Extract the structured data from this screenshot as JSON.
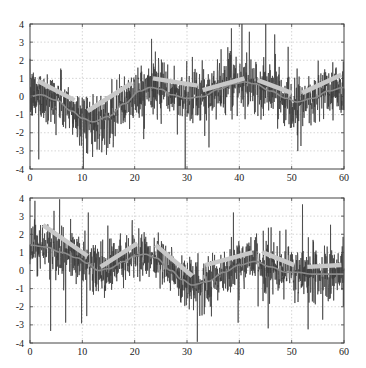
{
  "chart_data": [
    {
      "type": "line",
      "title": "",
      "xlabel": "",
      "ylabel": "",
      "xlim": [
        0,
        60
      ],
      "ylim": [
        -4,
        4
      ],
      "xticks": [
        0,
        10,
        20,
        30,
        40,
        50,
        60
      ],
      "yticks": [
        -4,
        -3,
        -2,
        -1,
        0,
        1,
        2,
        3,
        4
      ],
      "grid": true,
      "legend": null,
      "noise_std": 0.75,
      "series": [
        {
          "name": "noisy signal",
          "color": "#3a3a3a",
          "description": "dense high-frequency noisy trace around smooth curve"
        },
        {
          "name": "smooth underlying signal",
          "color": "#8a8a8a",
          "x": [
            0,
            2,
            5,
            8,
            10,
            12,
            15,
            18,
            21,
            23,
            25,
            27,
            30,
            33,
            36,
            39,
            41,
            43,
            46,
            49,
            51,
            54,
            57,
            60
          ],
          "y": [
            0.0,
            0.1,
            -0.2,
            -0.8,
            -1.2,
            -1.4,
            -1.1,
            -0.4,
            0.3,
            0.5,
            0.4,
            0.1,
            -0.1,
            0.0,
            0.4,
            0.7,
            0.8,
            0.7,
            0.3,
            -0.1,
            -0.3,
            -0.1,
            0.3,
            0.5
          ]
        },
        {
          "name": "piecewise linear trend segments",
          "color": "#c8c8c8",
          "segments": [
            [
              [
                1.5,
                0.85
              ],
              [
                8.5,
                -0.2
              ]
            ],
            [
              [
                11,
                -0.8
              ],
              [
                19.5,
                0.75
              ]
            ],
            [
              [
                23.5,
                1.0
              ],
              [
                32,
                0.6
              ]
            ],
            [
              [
                33,
                0.35
              ],
              [
                41,
                1.0
              ]
            ],
            [
              [
                43.5,
                0.9
              ],
              [
                50,
                0.2
              ]
            ],
            [
              [
                52,
                0.2
              ],
              [
                59.5,
                1.2
              ]
            ]
          ]
        }
      ]
    },
    {
      "type": "line",
      "title": "",
      "xlabel": "",
      "ylabel": "",
      "xlim": [
        0,
        60
      ],
      "ylim": [
        -4,
        4
      ],
      "xticks": [
        0,
        10,
        20,
        30,
        40,
        50,
        60
      ],
      "yticks": [
        -4,
        -3,
        -2,
        -1,
        0,
        1,
        2,
        3,
        4
      ],
      "grid": true,
      "legend": null,
      "noise_std": 0.7,
      "series": [
        {
          "name": "noisy signal",
          "color": "#3a3a3a",
          "description": "dense high-frequency noisy trace around smooth curve"
        },
        {
          "name": "smooth underlying signal",
          "color": "#8a8a8a",
          "x": [
            0,
            3,
            6,
            9,
            11,
            13,
            15,
            18,
            20,
            22,
            24,
            27,
            29,
            31,
            34,
            37,
            40,
            43,
            46,
            49,
            51,
            54,
            57,
            60
          ],
          "y": [
            1.4,
            1.3,
            1.0,
            0.7,
            0.4,
            0.0,
            0.1,
            0.5,
            0.8,
            0.9,
            0.7,
            0.0,
            -0.5,
            -0.8,
            -0.6,
            -0.1,
            0.3,
            0.5,
            0.2,
            -0.1,
            -0.1,
            -0.2,
            -0.2,
            -0.2
          ]
        },
        {
          "name": "piecewise linear trend segments",
          "color": "#c8c8c8",
          "segments": [
            [
              [
                2.5,
                2.5
              ],
              [
                11,
                0.8
              ]
            ],
            [
              [
                13.5,
                0.2
              ],
              [
                20.5,
                1.5
              ]
            ],
            [
              [
                24,
                1.4
              ],
              [
                31,
                -0.3
              ]
            ],
            [
              [
                33.5,
                0.3
              ],
              [
                42.5,
                1.0
              ]
            ],
            [
              [
                44.5,
                1.0
              ],
              [
                50.5,
                0.3
              ]
            ],
            [
              [
                53,
                0.2
              ],
              [
                59.5,
                0.3
              ]
            ]
          ]
        }
      ]
    }
  ],
  "layout": {
    "panels": [
      {
        "left": 30,
        "right": 344,
        "top": 24,
        "bottom": 169
      },
      {
        "left": 30,
        "right": 344,
        "top": 198,
        "bottom": 343
      }
    ]
  }
}
